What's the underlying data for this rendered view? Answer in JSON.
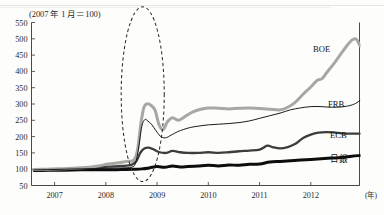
{
  "figure": {
    "unit_note": "(2007 年 1 月＝100)",
    "x_unit": "(年)"
  },
  "chart_data": {
    "type": "line",
    "title": "",
    "subtitle": "",
    "xlabel": "(年)",
    "ylabel": "(2007 年 1 月＝100)",
    "xlim": [
      2006.55,
      2012.95
    ],
    "ylim": [
      50,
      550
    ],
    "yticks": [
      50,
      100,
      150,
      200,
      250,
      300,
      350,
      400,
      450,
      500,
      550
    ],
    "xticks": [
      2007,
      2008,
      2009,
      2010,
      2011,
      2012
    ],
    "xtick_labels": [
      "2007",
      "2008",
      "2009",
      "2010",
      "2011",
      "2012"
    ],
    "grid": false,
    "legend": "inline-right-of-series",
    "annotations": [
      {
        "kind": "ellipse",
        "style": "dashed",
        "cx_year": 2008.72,
        "cy_value": 330,
        "rx_years": 0.42,
        "ry_value": 268,
        "label": ""
      }
    ],
    "series": [
      {
        "name": "BOE",
        "color": "#a8a8a2",
        "width": 3.0,
        "label_value": 470,
        "points": [
          [
            2006.6,
            99
          ],
          [
            2006.85,
            100
          ],
          [
            2007.1,
            101
          ],
          [
            2007.35,
            103
          ],
          [
            2007.6,
            105
          ],
          [
            2007.85,
            110
          ],
          [
            2008.05,
            116
          ],
          [
            2008.25,
            120
          ],
          [
            2008.42,
            124
          ],
          [
            2008.55,
            128
          ],
          [
            2008.62,
            160
          ],
          [
            2008.68,
            235
          ],
          [
            2008.74,
            288
          ],
          [
            2008.8,
            300
          ],
          [
            2008.88,
            296
          ],
          [
            2008.96,
            281
          ],
          [
            2009.04,
            236
          ],
          [
            2009.12,
            222
          ],
          [
            2009.2,
            245
          ],
          [
            2009.3,
            258
          ],
          [
            2009.42,
            250
          ],
          [
            2009.55,
            262
          ],
          [
            2009.7,
            276
          ],
          [
            2009.85,
            284
          ],
          [
            2010.0,
            288
          ],
          [
            2010.2,
            287
          ],
          [
            2010.4,
            285
          ],
          [
            2010.6,
            287
          ],
          [
            2010.8,
            288
          ],
          [
            2011.0,
            286
          ],
          [
            2011.2,
            284
          ],
          [
            2011.4,
            282
          ],
          [
            2011.55,
            290
          ],
          [
            2011.7,
            306
          ],
          [
            2011.85,
            330
          ],
          [
            2012.0,
            352
          ],
          [
            2012.12,
            372
          ],
          [
            2012.22,
            378
          ],
          [
            2012.32,
            398
          ],
          [
            2012.45,
            424
          ],
          [
            2012.58,
            452
          ],
          [
            2012.7,
            478
          ],
          [
            2012.8,
            496
          ],
          [
            2012.88,
            500
          ],
          [
            2012.93,
            488
          ],
          [
            2012.96,
            478
          ]
        ]
      },
      {
        "name": "FRB",
        "color": "#1a1a1a",
        "width": 1.0,
        "label_value": 300,
        "points": [
          [
            2006.6,
            98
          ],
          [
            2006.9,
            99
          ],
          [
            2007.2,
            100
          ],
          [
            2007.5,
            101
          ],
          [
            2007.8,
            102
          ],
          [
            2008.05,
            103
          ],
          [
            2008.3,
            104
          ],
          [
            2008.5,
            106
          ],
          [
            2008.58,
            118
          ],
          [
            2008.64,
            165
          ],
          [
            2008.7,
            230
          ],
          [
            2008.76,
            252
          ],
          [
            2008.82,
            248
          ],
          [
            2008.9,
            236
          ],
          [
            2008.98,
            218
          ],
          [
            2009.06,
            202
          ],
          [
            2009.16,
            196
          ],
          [
            2009.28,
            205
          ],
          [
            2009.4,
            215
          ],
          [
            2009.52,
            222
          ],
          [
            2009.65,
            228
          ],
          [
            2009.8,
            232
          ],
          [
            2010.0,
            236
          ],
          [
            2010.2,
            238
          ],
          [
            2010.4,
            240
          ],
          [
            2010.6,
            243
          ],
          [
            2010.8,
            248
          ],
          [
            2011.0,
            256
          ],
          [
            2011.2,
            264
          ],
          [
            2011.4,
            272
          ],
          [
            2011.6,
            282
          ],
          [
            2011.8,
            288
          ],
          [
            2012.0,
            292
          ],
          [
            2012.2,
            292
          ],
          [
            2012.4,
            290
          ],
          [
            2012.6,
            291
          ],
          [
            2012.78,
            296
          ],
          [
            2012.9,
            304
          ],
          [
            2012.96,
            312
          ]
        ]
      },
      {
        "name": "ECB",
        "color": "#3d3d3d",
        "width": 2.3,
        "label_value": 205,
        "points": [
          [
            2006.6,
            97
          ],
          [
            2006.9,
            99
          ],
          [
            2007.2,
            100
          ],
          [
            2007.5,
            102
          ],
          [
            2007.8,
            105
          ],
          [
            2008.05,
            108
          ],
          [
            2008.3,
            110
          ],
          [
            2008.5,
            113
          ],
          [
            2008.6,
            126
          ],
          [
            2008.68,
            152
          ],
          [
            2008.76,
            164
          ],
          [
            2008.84,
            166
          ],
          [
            2008.94,
            160
          ],
          [
            2009.05,
            152
          ],
          [
            2009.18,
            150
          ],
          [
            2009.3,
            156
          ],
          [
            2009.45,
            152
          ],
          [
            2009.6,
            150
          ],
          [
            2009.8,
            150
          ],
          [
            2010.0,
            152
          ],
          [
            2010.2,
            150
          ],
          [
            2010.4,
            152
          ],
          [
            2010.6,
            155
          ],
          [
            2010.8,
            157
          ],
          [
            2011.0,
            160
          ],
          [
            2011.15,
            172
          ],
          [
            2011.25,
            168
          ],
          [
            2011.4,
            164
          ],
          [
            2011.55,
            168
          ],
          [
            2011.7,
            178
          ],
          [
            2011.85,
            196
          ],
          [
            2012.0,
            206
          ],
          [
            2012.15,
            212
          ],
          [
            2012.3,
            214
          ],
          [
            2012.45,
            213
          ],
          [
            2012.6,
            210
          ],
          [
            2012.78,
            209
          ],
          [
            2012.96,
            209
          ]
        ]
      },
      {
        "name": "日銀",
        "color": "#0d0d0d",
        "width": 3.0,
        "label_value": 130,
        "points": [
          [
            2006.6,
            96
          ],
          [
            2006.9,
            97
          ],
          [
            2007.2,
            97
          ],
          [
            2007.5,
            98
          ],
          [
            2007.8,
            98
          ],
          [
            2008.05,
            98
          ],
          [
            2008.3,
            99
          ],
          [
            2008.55,
            100
          ],
          [
            2008.7,
            101
          ],
          [
            2008.85,
            104
          ],
          [
            2009.0,
            108
          ],
          [
            2009.15,
            106
          ],
          [
            2009.3,
            110
          ],
          [
            2009.45,
            107
          ],
          [
            2009.6,
            108
          ],
          [
            2009.8,
            110
          ],
          [
            2010.0,
            112
          ],
          [
            2010.2,
            110
          ],
          [
            2010.4,
            113
          ],
          [
            2010.6,
            112
          ],
          [
            2010.8,
            115
          ],
          [
            2011.0,
            116
          ],
          [
            2011.2,
            122
          ],
          [
            2011.4,
            124
          ],
          [
            2011.6,
            126
          ],
          [
            2011.8,
            128
          ],
          [
            2012.0,
            130
          ],
          [
            2012.2,
            132
          ],
          [
            2012.4,
            134
          ],
          [
            2012.6,
            136
          ],
          [
            2012.8,
            140
          ],
          [
            2012.96,
            142
          ]
        ]
      }
    ]
  },
  "axes": {
    "y_tick_labels": [
      "550",
      "500",
      "450",
      "400",
      "350",
      "300",
      "250",
      "200",
      "150",
      "100",
      "50"
    ],
    "x_tick_labels": [
      "2007",
      "2008",
      "2009",
      "2010",
      "2011",
      "2012"
    ]
  },
  "series_labels": [
    {
      "name": "BOE"
    },
    {
      "name": "FRB"
    },
    {
      "name": "ECB"
    },
    {
      "name": "日銀"
    }
  ]
}
